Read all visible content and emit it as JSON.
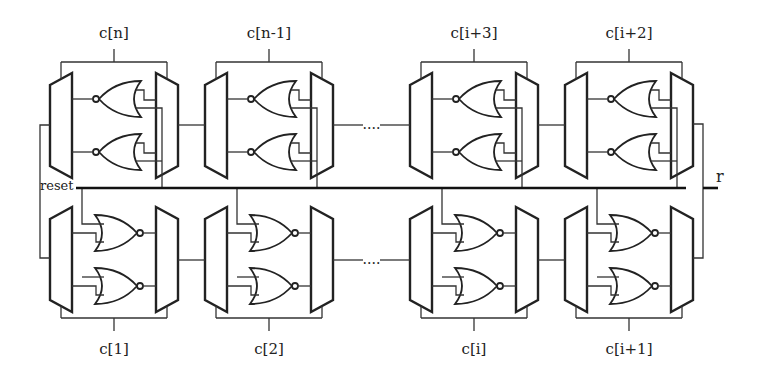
{
  "diagram": {
    "type": "circuit",
    "top_row": {
      "modules": [
        {
          "label": "c[n]",
          "x": 50
        },
        {
          "label": "c[n-1]",
          "x": 205
        },
        {
          "label": "c[i+3]",
          "x": 410
        },
        {
          "label": "c[i+2]",
          "x": 565
        }
      ],
      "gate_orientation": "left",
      "ellipsis": "...."
    },
    "bottom_row": {
      "modules": [
        {
          "label": "c[1]",
          "x": 50
        },
        {
          "label": "c[2]",
          "x": 205
        },
        {
          "label": "c[i]",
          "x": 410
        },
        {
          "label": "c[i+1]",
          "x": 565
        }
      ],
      "gate_orientation": "right",
      "ellipsis": "...."
    },
    "reset_label": "reset",
    "output_label": "r",
    "components_per_module": [
      "input-mux",
      "nor-gate",
      "nor-gate",
      "output-mux"
    ]
  }
}
